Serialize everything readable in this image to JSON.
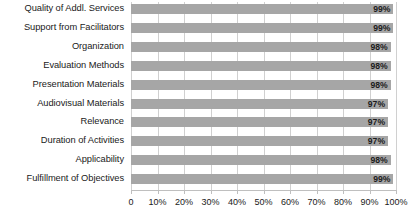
{
  "chart_data": {
    "type": "bar",
    "orientation": "horizontal",
    "title": "",
    "subtitle": "",
    "xlabel": "",
    "ylabel": "",
    "xlim": [
      0,
      100
    ],
    "grid": true,
    "legend": false,
    "bar_color": "#a6a6a6",
    "gridline_color": "#d0d0d0",
    "axis_color": "#bfbfbf",
    "categories": [
      "Quality of Addl. Services",
      "Support from Facilitators",
      "Organization",
      "Evaluation Methods",
      "Presentation Materials",
      "Audiovisual Materials",
      "Relevance",
      "Duration of Activities",
      "Applicability",
      "Fulfillment of Objectives"
    ],
    "values": [
      99,
      99,
      98,
      98,
      98,
      97,
      97,
      97,
      98,
      99
    ],
    "data_labels": [
      "99%",
      "99%",
      "98%",
      "98%",
      "98%",
      "97%",
      "97%",
      "97%",
      "98%",
      "99%"
    ],
    "xticks": [
      0,
      10,
      20,
      30,
      40,
      50,
      60,
      70,
      80,
      90,
      100
    ],
    "xticklabels": [
      "0",
      "10%",
      "20%",
      "30%",
      "40%",
      "50%",
      "60%",
      "70%",
      "80%",
      "90%",
      "100%"
    ]
  }
}
